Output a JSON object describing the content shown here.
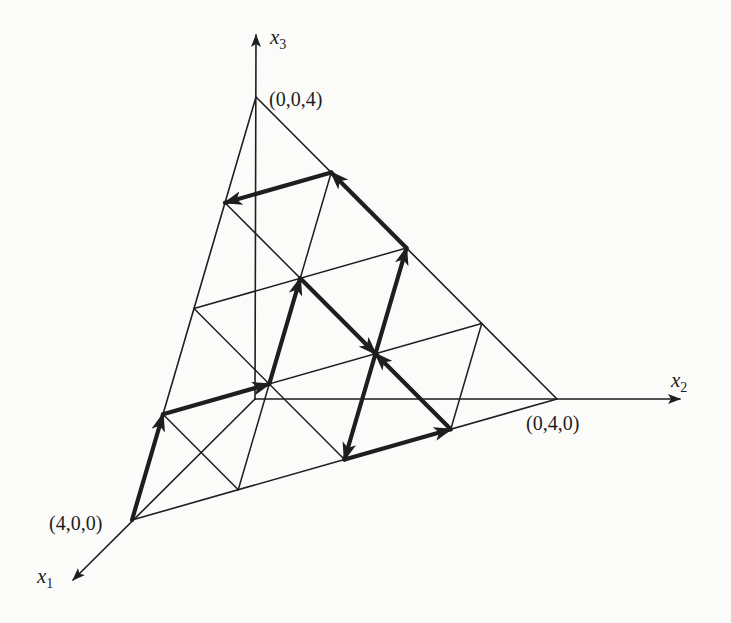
{
  "figure": {
    "type": "simplex-grid-path",
    "colors": {
      "background": "#fbfbfa",
      "ink": "#1e1e1e"
    },
    "axes": [
      {
        "name": "x1",
        "label": "x",
        "subscript": "1"
      },
      {
        "name": "x2",
        "label": "x",
        "subscript": "2"
      },
      {
        "name": "x3",
        "label": "x",
        "subscript": "3"
      }
    ],
    "vertex_labels": {
      "A": "(4,0,0)",
      "B": "(0,4,0)",
      "C": "(0,0,4)"
    },
    "grid_divisions": 4,
    "path": [
      [
        4,
        0,
        0
      ],
      [
        3,
        0,
        1
      ],
      [
        2,
        1,
        1
      ],
      [
        1,
        1,
        2
      ],
      [
        1,
        2,
        1
      ],
      [
        2,
        2,
        0
      ],
      [
        1,
        3,
        0
      ],
      [
        1,
        2,
        1
      ],
      [
        0,
        2,
        2
      ],
      [
        0,
        1,
        3
      ],
      [
        1,
        0,
        3
      ]
    ]
  }
}
